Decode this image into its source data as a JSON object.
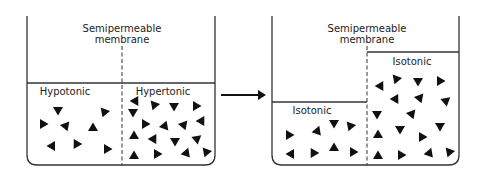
{
  "diagram": {
    "before": {
      "membrane_label_line1": "Semipermeable",
      "membrane_label_line2": "membrane",
      "left_label": "Hypotonic",
      "right_label": "Hypertonic"
    },
    "after": {
      "membrane_label_line1": "Semipermeable",
      "membrane_label_line2": "membrane",
      "left_label": "Isotonic",
      "right_label": "Isotonic"
    },
    "arrow": "right-arrow",
    "colors": {
      "line": "#333333",
      "solute": "#111111",
      "background": "#ffffff"
    }
  }
}
